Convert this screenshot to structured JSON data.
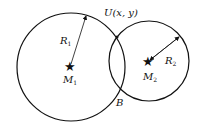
{
  "diagram": {
    "circle1": {
      "center_label": "M",
      "center_sub": "1",
      "radius_label": "R",
      "radius_sub": "1",
      "cx": 71,
      "cy": 67,
      "r": 54
    },
    "circle2": {
      "center_label": "M",
      "center_sub": "2",
      "radius_label": "R",
      "radius_sub": "2",
      "cx": 149,
      "cy": 61,
      "r": 40
    },
    "intersection_top": {
      "label": "U(x, y)"
    },
    "intersection_bottom": {
      "label": "B"
    },
    "colors": {
      "stroke": "#111111",
      "background": "#ffffff"
    }
  }
}
